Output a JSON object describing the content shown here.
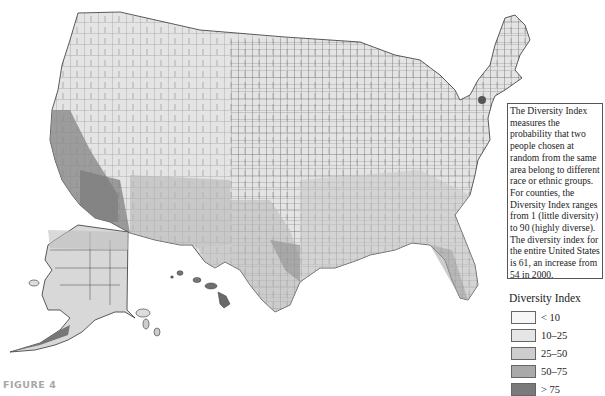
{
  "figure_label": "FIGURE 4",
  "info_box": {
    "text": "The Diversity Index measures the probability that two people chosen at random from the same area belong to different race or ethnic groups. For counties, the Diversity Index ranges from 1 (little diversity) to 90 (highly diverse). The diversity index for the entire United States is 61, an increase from 54 in 2000."
  },
  "legend": {
    "title": "Diversity Index",
    "items": [
      {
        "label": "< 10",
        "color": "#f7f7f7"
      },
      {
        "label": "10–25",
        "color": "#e6e6e6"
      },
      {
        "label": "25–50",
        "color": "#cdcdcd"
      },
      {
        "label": "50–75",
        "color": "#a9a9a9"
      },
      {
        "label": "> 75",
        "color": "#7a7a7a"
      }
    ]
  },
  "map": {
    "title": "Diversity Index by County, United States",
    "regions": [
      "Contiguous United States",
      "Alaska",
      "Hawaii"
    ],
    "border_color": "#333333",
    "high_diversity_areas": [
      "California",
      "Southwest border",
      "Texas",
      "Southeast",
      "New York metro",
      "Hawaii"
    ],
    "low_diversity_areas": [
      "Northern Plains",
      "Midwest",
      "Appalachia",
      "Northern New England"
    ]
  }
}
